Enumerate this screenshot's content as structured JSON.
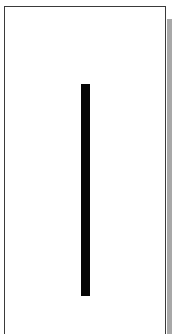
{
  "figure": {
    "frame": {
      "border_color": "#3a3a3a",
      "background": "#ffffff",
      "shadow_color": "#a8a8a8"
    },
    "bar": {
      "color": "#050505",
      "orientation": "vertical"
    }
  }
}
